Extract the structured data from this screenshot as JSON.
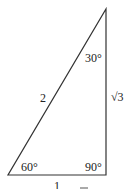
{
  "diagram": {
    "type": "right-triangle-30-60-90",
    "sides": {
      "hypotenuse": "2",
      "short_leg": "1",
      "long_leg": "√3"
    },
    "angles": {
      "top": "30°",
      "bottom_left": "60°",
      "bottom_right": "90°"
    },
    "stroke_color": "#333333"
  }
}
